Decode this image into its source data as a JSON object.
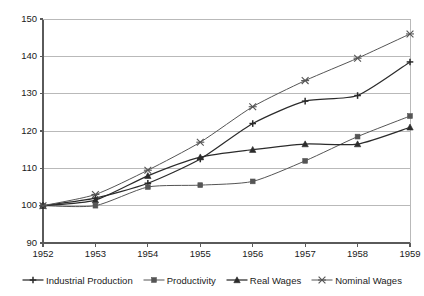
{
  "chart_data": {
    "type": "line",
    "title": "",
    "subtitle": "",
    "xlabel": "",
    "ylabel": "",
    "categories": [
      "1952",
      "1953",
      "1954",
      "1955",
      "1956",
      "1957",
      "1958",
      "1959"
    ],
    "x": [
      1952,
      1953,
      1954,
      1955,
      1956,
      1957,
      1958,
      1959
    ],
    "xlim": [
      1952,
      1959
    ],
    "ylim": [
      90,
      150
    ],
    "yticks": [
      90,
      100,
      110,
      120,
      130,
      140,
      150
    ],
    "xticks": [
      "1952",
      "1953",
      "1954",
      "1955",
      "1956",
      "1957",
      "1958",
      "1959"
    ],
    "grid": "horizontal",
    "legend_position": "bottom",
    "series": [
      {
        "name": "Industrial Production",
        "marker": "plus",
        "color": "#2b2b2b",
        "values": [
          100,
          102,
          106,
          112.5,
          122,
          128,
          129.5,
          138.5
        ]
      },
      {
        "name": "Productivity",
        "marker": "square",
        "color": "#555555",
        "values": [
          100,
          100,
          105,
          105.5,
          106.5,
          112,
          118.5,
          124
        ]
      },
      {
        "name": "Real Wages",
        "marker": "triangle",
        "color": "#2b2b2b",
        "values": [
          100,
          101.5,
          108,
          113,
          115,
          116.5,
          116.5,
          121
        ]
      },
      {
        "name": "Nominal Wages",
        "marker": "x",
        "color": "#555555",
        "values": [
          100,
          103,
          109.5,
          117,
          126.5,
          133.5,
          139.5,
          146
        ]
      }
    ]
  },
  "axes": {
    "y_tick_labels": [
      "150",
      "140",
      "130",
      "120",
      "110",
      "100",
      "90"
    ],
    "x_tick_labels": [
      "1952",
      "1953",
      "1954",
      "1955",
      "1956",
      "1957",
      "1958",
      "1959"
    ]
  },
  "legend": {
    "items": [
      {
        "label": "Industrial Production",
        "marker": "plus-marker"
      },
      {
        "label": "Productivity",
        "marker": "square-marker"
      },
      {
        "label": "Real Wages",
        "marker": "triangle-marker"
      },
      {
        "label": "Nominal Wages",
        "marker": "x-marker"
      }
    ]
  },
  "style": {
    "plot_border": "#6f6f6f",
    "gridline": "#b9b9b9",
    "axis_text": "#1a1a1a",
    "background": "#ffffff"
  }
}
